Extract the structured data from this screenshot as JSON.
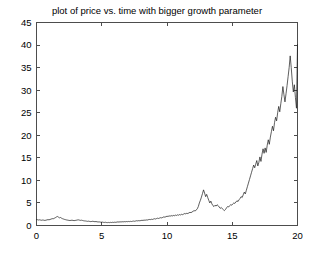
{
  "figure": {
    "title": "plot of price vs. time with bigger growth parameter",
    "background_color": "#ffffff",
    "axis_color": "#4d4d4d",
    "line_color": "#1a1a1a"
  },
  "chart_data": {
    "type": "line",
    "title": "plot of price vs. time with bigger growth parameter",
    "xlabel": "",
    "ylabel": "",
    "xlim": [
      0,
      20
    ],
    "ylim": [
      0,
      45
    ],
    "xticks": [
      0,
      5,
      10,
      15,
      20
    ],
    "yticks": [
      0,
      5,
      10,
      15,
      20,
      25,
      30,
      35,
      40,
      45
    ],
    "xtick_labels": [
      "0",
      "5",
      "10",
      "15",
      "20"
    ],
    "ytick_labels": [
      "0",
      "5",
      "10",
      "15",
      "20",
      "25",
      "30",
      "35",
      "40",
      "45"
    ],
    "grid": false,
    "legend": null,
    "series": [
      {
        "name": "price",
        "x": [
          0.0,
          0.08,
          0.16,
          0.24,
          0.32,
          0.4,
          0.48,
          0.56,
          0.64,
          0.72,
          0.8,
          0.88,
          0.96,
          1.04,
          1.12,
          1.2,
          1.28,
          1.36,
          1.44,
          1.52,
          1.6,
          1.68,
          1.76,
          1.84,
          1.92,
          2.0,
          2.08,
          2.16,
          2.24,
          2.32,
          2.4,
          2.48,
          2.56,
          2.64,
          2.72,
          2.8,
          2.88,
          2.96,
          3.04,
          3.12,
          3.2,
          3.28,
          3.36,
          3.44,
          3.52,
          3.6,
          3.68,
          3.76,
          3.84,
          3.92,
          4.0,
          4.08,
          4.16,
          4.24,
          4.32,
          4.4,
          4.48,
          4.56,
          4.64,
          4.72,
          4.8,
          4.88,
          4.96,
          5.04,
          5.12,
          5.2,
          5.28,
          5.36,
          5.44,
          5.52,
          5.6,
          5.68,
          5.76,
          5.84,
          5.92,
          6.0,
          6.08,
          6.16,
          6.24,
          6.32,
          6.4,
          6.48,
          6.56,
          6.64,
          6.72,
          6.8,
          6.88,
          6.96,
          7.04,
          7.12,
          7.2,
          7.28,
          7.36,
          7.44,
          7.52,
          7.6,
          7.68,
          7.76,
          7.84,
          7.92,
          8.0,
          8.08,
          8.16,
          8.24,
          8.32,
          8.4,
          8.48,
          8.56,
          8.64,
          8.72,
          8.8,
          8.88,
          8.96,
          9.04,
          9.12,
          9.2,
          9.28,
          9.36,
          9.44,
          9.52,
          9.6,
          9.68,
          9.76,
          9.84,
          9.92,
          10.0,
          10.08,
          10.16,
          10.24,
          10.32,
          10.4,
          10.48,
          10.56,
          10.64,
          10.72,
          10.8,
          10.88,
          10.96,
          11.04,
          11.12,
          11.2,
          11.28,
          11.36,
          11.44,
          11.52,
          11.6,
          11.68,
          11.76,
          11.84,
          11.92,
          12.0,
          12.08,
          12.16,
          12.24,
          12.32,
          12.4,
          12.48,
          12.56,
          12.64,
          12.72,
          12.8,
          12.88,
          12.96,
          13.04,
          13.12,
          13.2,
          13.28,
          13.36,
          13.44,
          13.52,
          13.6,
          13.68,
          13.76,
          13.84,
          13.92,
          14.0,
          14.08,
          14.16,
          14.24,
          14.32,
          14.4,
          14.48,
          14.56,
          14.64,
          14.72,
          14.8,
          14.88,
          14.96,
          15.04,
          15.12,
          15.2,
          15.28,
          15.36,
          15.44,
          15.52,
          15.6,
          15.68,
          15.76,
          15.84,
          15.92,
          16.0,
          16.08,
          16.16,
          16.24,
          16.32,
          16.4,
          16.48,
          16.56,
          16.64,
          16.72,
          16.8,
          16.88,
          16.96,
          17.04,
          17.12,
          17.2,
          17.28,
          17.36,
          17.44,
          17.52,
          17.6,
          17.68,
          17.76,
          17.84,
          17.92,
          18.0,
          18.08,
          18.16,
          18.24,
          18.32,
          18.4,
          18.48,
          18.56,
          18.64,
          18.72,
          18.8,
          18.88,
          18.96,
          19.04,
          19.12,
          19.2,
          19.28,
          19.36,
          19.44,
          19.52,
          19.6,
          19.68,
          19.76,
          19.84,
          19.92,
          20.0
        ],
        "y": [
          1.3,
          1.28,
          1.22,
          1.26,
          1.2,
          1.16,
          1.22,
          1.18,
          1.12,
          1.18,
          1.24,
          1.3,
          1.26,
          1.34,
          1.42,
          1.52,
          1.48,
          1.6,
          1.72,
          1.88,
          2.0,
          1.86,
          1.7,
          1.78,
          1.62,
          1.5,
          1.42,
          1.34,
          1.28,
          1.22,
          1.18,
          1.14,
          1.1,
          1.14,
          1.18,
          1.12,
          1.08,
          1.12,
          1.16,
          1.22,
          1.26,
          1.2,
          1.14,
          1.18,
          1.12,
          1.06,
          1.02,
          1.0,
          0.96,
          0.92,
          0.96,
          0.9,
          0.86,
          0.9,
          0.94,
          0.88,
          0.84,
          0.88,
          0.82,
          0.78,
          0.8,
          0.76,
          0.72,
          0.76,
          0.7,
          0.68,
          0.72,
          0.66,
          0.64,
          0.68,
          0.64,
          0.7,
          0.66,
          0.72,
          0.68,
          0.74,
          0.7,
          0.76,
          0.8,
          0.76,
          0.82,
          0.78,
          0.84,
          0.8,
          0.86,
          0.82,
          0.88,
          0.84,
          0.9,
          0.86,
          0.92,
          0.88,
          0.94,
          0.98,
          0.94,
          1.0,
          1.06,
          1.02,
          1.08,
          1.04,
          1.1,
          1.16,
          1.12,
          1.2,
          1.16,
          1.24,
          1.2,
          1.28,
          1.34,
          1.3,
          1.38,
          1.34,
          1.42,
          1.5,
          1.44,
          1.54,
          1.62,
          1.56,
          1.66,
          1.74,
          1.68,
          1.8,
          1.92,
          1.84,
          1.96,
          2.06,
          2.0,
          2.14,
          2.06,
          2.2,
          2.1,
          2.24,
          2.16,
          2.3,
          2.22,
          2.36,
          2.28,
          2.42,
          2.34,
          2.48,
          2.4,
          2.54,
          2.66,
          2.58,
          2.72,
          2.64,
          2.8,
          2.92,
          2.84,
          3.0,
          3.16,
          3.3,
          3.2,
          3.45,
          3.7,
          4.2,
          5.0,
          5.6,
          6.3,
          7.1,
          7.9,
          7.2,
          6.4,
          6.9,
          6.2,
          5.6,
          5.0,
          5.4,
          4.8,
          4.4,
          4.2,
          4.5,
          4.3,
          4.6,
          4.4,
          4.1,
          3.8,
          4.0,
          3.7,
          3.5,
          3.3,
          3.55,
          3.9,
          4.2,
          4.1,
          4.4,
          4.6,
          4.5,
          4.8,
          5.0,
          4.9,
          5.2,
          5.5,
          5.3,
          5.7,
          6.0,
          6.4,
          6.2,
          6.8,
          7.4,
          7.0,
          7.8,
          8.6,
          9.4,
          10.2,
          11.0,
          11.8,
          12.6,
          13.4,
          12.8,
          13.6,
          14.4,
          13.2,
          14.0,
          15.2,
          14.2,
          15.8,
          17.0,
          16.0,
          17.2,
          16.2,
          17.8,
          19.0,
          18.0,
          19.6,
          20.8,
          22.0,
          21.0,
          22.8,
          24.0,
          23.2,
          25.0,
          26.4,
          25.2,
          27.0,
          28.6,
          30.8,
          29.0,
          27.4,
          29.2,
          31.0,
          33.0,
          35.0,
          37.6,
          35.0,
          32.0,
          29.6,
          31.2,
          28.4,
          26.0,
          40.1
        ]
      }
    ]
  },
  "axes": {
    "x_ticks": [
      {
        "value": 0,
        "label": "0"
      },
      {
        "value": 5,
        "label": "5"
      },
      {
        "value": 10,
        "label": "10"
      },
      {
        "value": 15,
        "label": "15"
      },
      {
        "value": 20,
        "label": "20"
      }
    ],
    "y_ticks": [
      {
        "value": 0,
        "label": "0"
      },
      {
        "value": 5,
        "label": "5"
      },
      {
        "value": 10,
        "label": "10"
      },
      {
        "value": 15,
        "label": "15"
      },
      {
        "value": 20,
        "label": "20"
      },
      {
        "value": 25,
        "label": "25"
      },
      {
        "value": 30,
        "label": "30"
      },
      {
        "value": 35,
        "label": "35"
      },
      {
        "value": 40,
        "label": "40"
      },
      {
        "value": 45,
        "label": "45"
      }
    ]
  }
}
